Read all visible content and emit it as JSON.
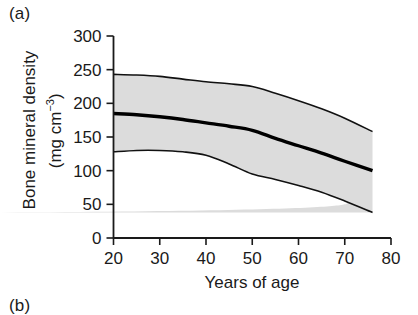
{
  "figure": {
    "panel_a_label": "(a)",
    "panel_b_label": "(b)"
  },
  "axes": {
    "ylabel_line1": "Bone mineral density",
    "ylabel_line2_prefix": "(mg cm",
    "ylabel_line2_exponent": "−3",
    "ylabel_line2_suffix": ")",
    "xlabel": "Years of age"
  },
  "chart_data": {
    "type": "line",
    "title": "",
    "xlabel": "Years of age",
    "ylabel": "Bone mineral density (mg cm-3)",
    "xlim": [
      20,
      80
    ],
    "ylim": [
      0,
      300
    ],
    "xticks": [
      20,
      30,
      40,
      50,
      60,
      70,
      80
    ],
    "xtick_labels": [
      "20",
      "30",
      "40",
      "50",
      "60",
      "70",
      "80"
    ],
    "yticks": [
      0,
      50,
      100,
      150,
      200,
      250,
      300
    ],
    "ytick_labels": [
      "0",
      "50",
      "100",
      "150",
      "200",
      "250",
      "300"
    ],
    "grid": false,
    "legend": null,
    "series": [
      {
        "name": "mean",
        "style": "solid-thick-black",
        "x": [
          20,
          25,
          30,
          35,
          40,
          45,
          50,
          55,
          60,
          65,
          70,
          76
        ],
        "values": [
          185,
          183,
          180,
          176,
          171,
          166,
          160,
          148,
          137,
          126,
          114,
          100
        ]
      },
      {
        "name": "upper limit",
        "style": "solid-thin-black",
        "x": [
          20,
          25,
          30,
          35,
          40,
          45,
          50,
          55,
          60,
          65,
          70,
          76
        ],
        "values": [
          243,
          242,
          240,
          236,
          232,
          229,
          225,
          215,
          204,
          192,
          178,
          158
        ]
      },
      {
        "name": "lower limit",
        "style": "solid-thin-black",
        "x": [
          20,
          25,
          30,
          35,
          40,
          45,
          50,
          55,
          60,
          65,
          70,
          76
        ],
        "values": [
          128,
          130,
          130,
          128,
          123,
          110,
          95,
          87,
          78,
          68,
          55,
          38
        ]
      }
    ],
    "band": {
      "name": "reference range shading",
      "fill": "#dcdcdc",
      "between": [
        "lower limit",
        "upper limit"
      ]
    }
  }
}
